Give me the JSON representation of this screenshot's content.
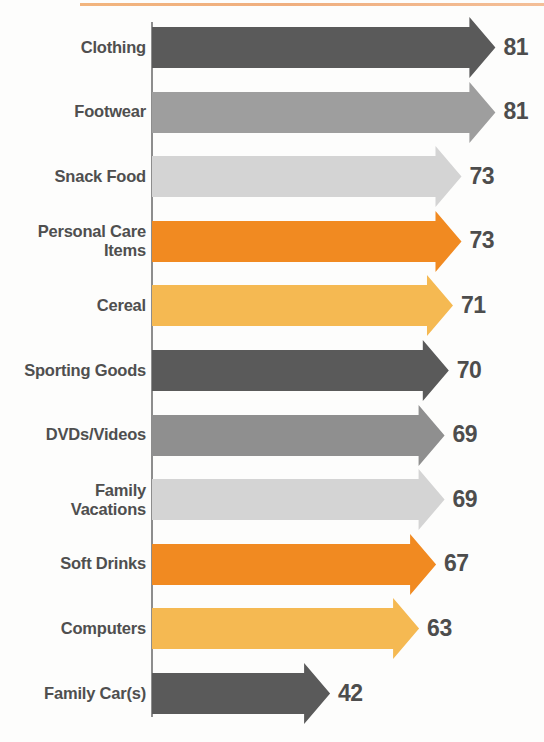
{
  "chart_data": {
    "type": "bar",
    "orientation": "horizontal",
    "title": "",
    "subtitle": "",
    "xlabel": "",
    "ylabel": "",
    "xlim": [
      0,
      90
    ],
    "grid": false,
    "legend": false,
    "marker_style": "arrow",
    "categories": [
      "Clothing",
      "Footwear",
      "Snack Food",
      "Personal Care Items",
      "Cereal",
      "Sporting Goods",
      "DVDs/Videos",
      "Family Vacations",
      "Soft Drinks",
      "Computers",
      "Family Car(s)"
    ],
    "values": [
      81,
      81,
      73,
      73,
      71,
      70,
      69,
      69,
      67,
      63,
      42
    ],
    "value_labels": [
      "81",
      "81",
      "73",
      "73",
      "71",
      "70",
      "69",
      "69",
      "67",
      "63",
      "42"
    ],
    "bar_colors": [
      "#5a5a5a",
      "#9e9e9e",
      "#d4d4d4",
      "#f18a21",
      "#f5b952",
      "#5a5a5a",
      "#8f8f8f",
      "#d4d4d4",
      "#f18a21",
      "#f5b952",
      "#5a5a5a"
    ]
  },
  "rows": [
    {
      "label_line1": "Clothing",
      "label_line2": "",
      "value": "81",
      "color": "#5a5a5a"
    },
    {
      "label_line1": "Footwear",
      "label_line2": "",
      "value": "81",
      "color": "#9e9e9e"
    },
    {
      "label_line1": "Snack Food",
      "label_line2": "",
      "value": "73",
      "color": "#d4d4d4"
    },
    {
      "label_line1": "Personal Care",
      "label_line2": "Items",
      "value": "73",
      "color": "#f18a21"
    },
    {
      "label_line1": "Cereal",
      "label_line2": "",
      "value": "71",
      "color": "#f5b952"
    },
    {
      "label_line1": "Sporting Goods",
      "label_line2": "",
      "value": "70",
      "color": "#5a5a5a"
    },
    {
      "label_line1": "DVDs/Videos",
      "label_line2": "",
      "value": "69",
      "color": "#8f8f8f"
    },
    {
      "label_line1": "Family",
      "label_line2": "Vacations",
      "value": "69",
      "color": "#d4d4d4"
    },
    {
      "label_line1": "Soft Drinks",
      "label_line2": "",
      "value": "67",
      "color": "#f18a21"
    },
    {
      "label_line1": "Computers",
      "label_line2": "",
      "value": "63",
      "color": "#f5b952"
    },
    {
      "label_line1": "Family Car(s)",
      "label_line2": "",
      "value": "42",
      "color": "#5a5a5a"
    }
  ],
  "style": {
    "accent_rule_color": "#eda169",
    "axis_color": "#8d8d8d",
    "label_color": "#4f4f4f",
    "value_color": "#4d4d4d",
    "background": "#fdfdfc"
  }
}
